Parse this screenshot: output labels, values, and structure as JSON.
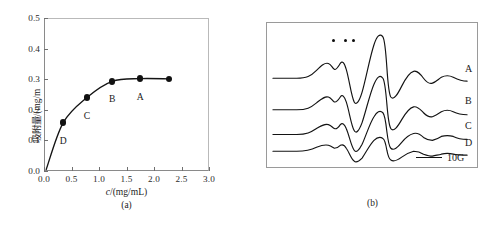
{
  "figure": {
    "panels": [
      {
        "id": "a",
        "caption": "(a)"
      },
      {
        "id": "b",
        "caption": "(b)"
      }
    ]
  },
  "panel_a": {
    "caption": "(a)",
    "ylabel": "吸附量/(mg/m",
    "xlabel_italic": "c",
    "xlabel_rest": "/(mg/mL)"
  },
  "panel_b": {
    "caption": "(b)",
    "trace_labels": [
      "A",
      "B",
      "C",
      "D"
    ],
    "scalebar_label": "10G",
    "marker_count": 3
  },
  "chart_data": [
    {
      "type": "line",
      "title": "",
      "xlabel": "c/(mg/mL)",
      "ylabel": "吸附量/(mg/m",
      "xlim": [
        0.0,
        3.0
      ],
      "ylim": [
        0.0,
        0.5
      ],
      "xticks": [
        "0.0",
        "0.5",
        "1.0",
        "1.5",
        "2.0",
        "2.5",
        "3.0"
      ],
      "xtick_values": [
        0.0,
        0.5,
        1.0,
        1.5,
        2.0,
        2.5,
        3.0
      ],
      "yticks": [
        "0.0",
        "0.1",
        "0.2",
        "0.3",
        "0.4",
        "0.5"
      ],
      "ytick_values": [
        0.0,
        0.1,
        0.2,
        0.3,
        0.4,
        0.5
      ],
      "grid": false,
      "legend": "none",
      "marker": "filled-circle",
      "x": [
        0.04,
        0.35,
        0.78,
        1.24,
        1.75,
        2.27
      ],
      "y": [
        0.005,
        0.158,
        0.24,
        0.293,
        0.302,
        0.301
      ],
      "point_labels": [
        "",
        "D",
        "C",
        "B",
        "A",
        ""
      ],
      "point_label_offsets_px": [
        0,
        12,
        12,
        12,
        12,
        0
      ],
      "series": [
        {
          "name": "adsorption isotherm",
          "x": [
            0.04,
            0.35,
            0.78,
            1.24,
            1.75,
            2.27
          ],
          "values": [
            0.005,
            0.158,
            0.24,
            0.293,
            0.302,
            0.301
          ]
        }
      ],
      "annotations": [
        {
          "label": "D",
          "x": 0.35,
          "y": 0.158
        },
        {
          "label": "C",
          "x": 0.78,
          "y": 0.24
        },
        {
          "label": "B",
          "x": 1.24,
          "y": 0.293
        },
        {
          "label": "A",
          "x": 1.75,
          "y": 0.302
        }
      ]
    },
    {
      "type": "line",
      "title": "",
      "xlabel": "",
      "ylabel": "",
      "grid": false,
      "legend": "right",
      "axis_visible": false,
      "scalebar": "10G",
      "annotations": [
        {
          "label": "•",
          "note": "marker dot 1 over low-field shoulder"
        },
        {
          "label": "•",
          "note": "marker dot 2 over low-field shoulder"
        },
        {
          "label": "•",
          "note": "marker dot 3 over low-field shoulder"
        }
      ],
      "series": [
        {
          "name": "A",
          "baseline_y": 56,
          "amplitude": 1.0,
          "path": "M 6 56 L 30 56 C 40 56 44 54 50 48 C 55 43 58 40 62 41 C 65 42 66 46 68 47 C 70 48 72 44 74 41 C 76 38 78 40 80 47 C 83 57 85 74 88 80 C 90 84 93 80 96 70 C 100 56 104 34 108 22 C 111 13 114 10 117 14 C 119 17 120 30 121 45 C 122 60 123 72 125 75 C 128 79 132 72 136 64 C 140 56 144 50 148 49 C 152 48 155 52 158 56 C 161 60 164 62 167 61 C 170 60 173 57 176 55 C 180 53 184 53 188 55 C 192 57 196 59 202 59"
        },
        {
          "name": "B",
          "baseline_y": 88,
          "amplitude": 0.82,
          "path": "M 6 88 L 30 88 C 40 88 44 86 50 81 C 55 77 58 74 62 75 C 65 76 66 79 68 80 C 70 81 72 78 74 75 C 76 72 78 74 80 80 C 83 89 85 104 88 109 C 90 113 93 109 96 101 C 100 89 104 71 108 62 C 111 55 114 52 117 56 C 119 59 120 70 121 82 C 122 94 123 104 125 107 C 128 111 132 105 136 98 C 140 91 144 86 148 85 C 152 84 155 88 158 91 C 161 94 164 96 167 95 C 170 94 173 92 176 90 C 180 88 184 88 188 90 C 192 92 196 93 202 93"
        },
        {
          "name": "C",
          "baseline_y": 113,
          "amplitude": 0.62,
          "path": "M 6 113 L 30 113 C 40 113 44 111 50 107 C 55 104 58 102 62 103 C 65 104 66 106 68 107 C 70 108 72 106 74 103 C 76 101 78 102 80 107 C 83 114 85 125 88 129 C 90 132 93 129 96 123 C 100 114 104 101 108 95 C 111 90 114 88 117 91 C 119 93 120 101 121 110 C 122 118 123 125 125 127 C 128 130 132 126 136 121 C 140 116 144 113 148 112 C 152 111 155 113 158 116 C 161 118 164 119 167 119 C 170 118 173 117 176 115 C 180 114 184 114 188 115 C 192 117 196 118 202 118"
        },
        {
          "name": "D",
          "baseline_y": 130,
          "amplitude": 0.38,
          "path": "M 6 130 L 30 130 C 40 130 44 129 50 126 C 55 124 58 123 62 124 C 65 125 66 126 68 127 C 70 127 72 126 74 124 C 76 123 78 123 80 127 C 83 131 85 138 88 140 C 90 142 93 140 96 137 C 100 131 104 123 108 119 C 111 116 114 115 117 117 C 119 118 120 123 121 129 C 122 134 123 138 125 139 C 128 141 132 139 136 136 C 140 133 144 131 148 130 C 152 130 155 131 158 133 C 161 134 164 135 167 135 C 170 134 173 134 176 133 C 180 132 184 132 188 133 C 192 134 196 134 202 134"
        }
      ]
    }
  ]
}
